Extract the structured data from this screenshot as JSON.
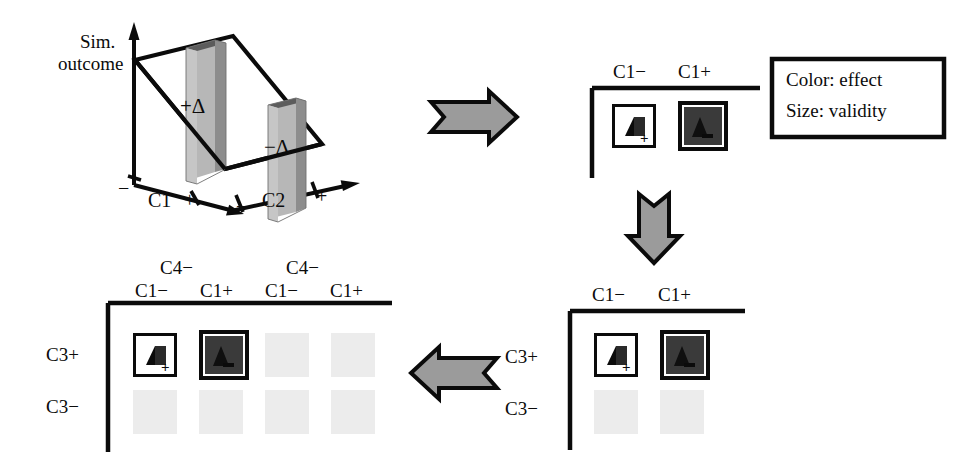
{
  "figure": {
    "title_hidden": "",
    "colors": {
      "ink": "#0b0b0b",
      "arrow_fill": "#9b9b9b",
      "bar_face": "#b4b4b4",
      "bar_side": "#8e8e8e",
      "bar_top": "#5a5a5a",
      "cell_dark": "#3a3a3a",
      "cell_light": "#ffffff",
      "cell_faded": "#ececec"
    }
  },
  "panel_3d": {
    "name": "simulation-outcome-3d-plot",
    "y_axis_label_line1": "Sim.",
    "y_axis_label_line2": "outcome",
    "x_axis_label": "C1",
    "z_axis_label": "C2",
    "x_tick_minus": "−",
    "x_tick_plus": "+",
    "z_tick_minus": "−",
    "z_tick_plus": "+",
    "bar_tall_label": "+Δ",
    "bar_short_label": "−Δ",
    "bars": [
      {
        "name": "bar-positive-delta",
        "label": "+Δ",
        "relative_height": 1.0
      },
      {
        "name": "bar-negative-delta",
        "label": "−Δ",
        "relative_height": 0.55
      }
    ]
  },
  "legend": {
    "name": "legend-box",
    "line1": "Color: effect",
    "line2": "Size: validity"
  },
  "panel_top_right": {
    "name": "grid-panel-c1",
    "col_headers": [
      "C1−",
      "C1+"
    ],
    "cells": [
      {
        "name": "cell-c1-minus",
        "style": "light",
        "glyph": "Δ",
        "sign": "+",
        "faded": false
      },
      {
        "name": "cell-c1-plus",
        "style": "dark",
        "glyph": "Δ",
        "sign": "−",
        "faded": false
      }
    ]
  },
  "panel_bottom_right": {
    "name": "grid-panel-c1-c3",
    "col_headers": [
      "C1−",
      "C1+"
    ],
    "row_headers": [
      "C3+",
      "C3−"
    ],
    "rows": [
      [
        {
          "name": "cell-c3plus-c1minus",
          "style": "light",
          "glyph": "Δ",
          "sign": "+",
          "faded": false
        },
        {
          "name": "cell-c3plus-c1plus",
          "style": "dark",
          "glyph": "Δ",
          "sign": "−",
          "faded": false
        }
      ],
      [
        {
          "name": "cell-c3minus-c1minus",
          "style": "faded",
          "glyph": "",
          "sign": "",
          "faded": true
        },
        {
          "name": "cell-c3minus-c1plus",
          "style": "faded",
          "glyph": "",
          "sign": "",
          "faded": true
        }
      ]
    ]
  },
  "panel_bottom_left": {
    "name": "grid-panel-c1-c3-c4",
    "super_headers": [
      "C4−",
      "C4−"
    ],
    "col_headers": [
      "C1−",
      "C1+",
      "C1−",
      "C1+"
    ],
    "row_headers": [
      "C3+",
      "C3−"
    ],
    "rows": [
      [
        {
          "name": "cell-c4minus-a-c3plus-c1minus",
          "style": "light",
          "glyph": "Δ",
          "sign": "+",
          "faded": false
        },
        {
          "name": "cell-c4minus-a-c3plus-c1plus",
          "style": "dark",
          "glyph": "Δ",
          "sign": "−",
          "faded": false
        },
        {
          "name": "cell-c4minus-b-c3plus-c1minus",
          "style": "faded",
          "glyph": "",
          "sign": "",
          "faded": true
        },
        {
          "name": "cell-c4minus-b-c3plus-c1plus",
          "style": "faded",
          "glyph": "",
          "sign": "",
          "faded": true
        }
      ],
      [
        {
          "name": "cell-c4minus-a-c3minus-c1minus",
          "style": "faded",
          "glyph": "",
          "sign": "",
          "faded": true
        },
        {
          "name": "cell-c4minus-a-c3minus-c1plus",
          "style": "faded",
          "glyph": "",
          "sign": "",
          "faded": true
        },
        {
          "name": "cell-c4minus-b-c3minus-c1minus",
          "style": "faded",
          "glyph": "",
          "sign": "",
          "faded": true
        },
        {
          "name": "cell-c4minus-b-c3minus-c1plus",
          "style": "faded",
          "glyph": "",
          "sign": "",
          "faded": true
        }
      ]
    ]
  },
  "arrows": [
    {
      "name": "arrow-right-top",
      "direction": "right"
    },
    {
      "name": "arrow-down-right",
      "direction": "down"
    },
    {
      "name": "arrow-left-bottom",
      "direction": "left"
    }
  ]
}
